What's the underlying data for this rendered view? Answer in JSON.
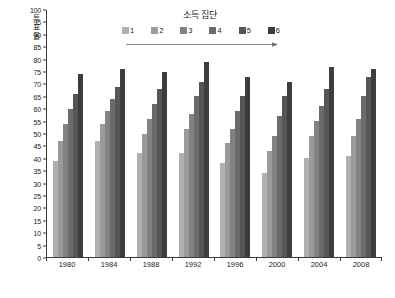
{
  "chart_data": {
    "type": "bar",
    "title": "소득 집단",
    "xlabel": "",
    "ylabel": "투표율",
    "ylim": [
      0,
      100
    ],
    "ytick_step": 5,
    "grid": false,
    "legend_position": "top",
    "categories": [
      "1980",
      "1984",
      "1988",
      "1992",
      "1996",
      "2000",
      "2004",
      "2008"
    ],
    "ytick_labels": [
      "0",
      "5",
      "10",
      "15",
      "20",
      "25",
      "30",
      "35",
      "40",
      "45",
      "50",
      "55",
      "60",
      "65",
      "70",
      "75",
      "80",
      "85",
      "90",
      "95",
      "100"
    ],
    "series": [
      {
        "name": "1",
        "color": "#b0b0b0",
        "values": [
          39,
          47,
          42,
          42,
          38,
          34,
          40,
          41
        ]
      },
      {
        "name": "2",
        "color": "#9a9a9a",
        "values": [
          47,
          54,
          50,
          52,
          46,
          43,
          49,
          49
        ]
      },
      {
        "name": "3",
        "color": "#828282",
        "values": [
          54,
          59,
          56,
          58,
          52,
          49,
          55,
          56
        ]
      },
      {
        "name": "4",
        "color": "#6b6b6b",
        "values": [
          60,
          64,
          62,
          65,
          59,
          57,
          61,
          65
        ]
      },
      {
        "name": "5",
        "color": "#565656",
        "values": [
          66,
          69,
          68,
          71,
          65,
          65,
          68,
          73
        ]
      },
      {
        "name": "6",
        "color": "#3d3d3d",
        "values": [
          74,
          76,
          75,
          79,
          73,
          71,
          77,
          76
        ]
      }
    ]
  },
  "legend": {
    "items": [
      {
        "label": "1",
        "color": "#b0b0b0"
      },
      {
        "label": "2",
        "color": "#9a9a9a"
      },
      {
        "label": "3",
        "color": "#828282"
      },
      {
        "label": "4",
        "color": "#6b6b6b"
      },
      {
        "label": "5",
        "color": "#565656"
      },
      {
        "label": "6",
        "color": "#3d3d3d"
      }
    ],
    "arrow_color": "#808080"
  },
  "axis": {
    "line_color": "#3a3a3a"
  }
}
